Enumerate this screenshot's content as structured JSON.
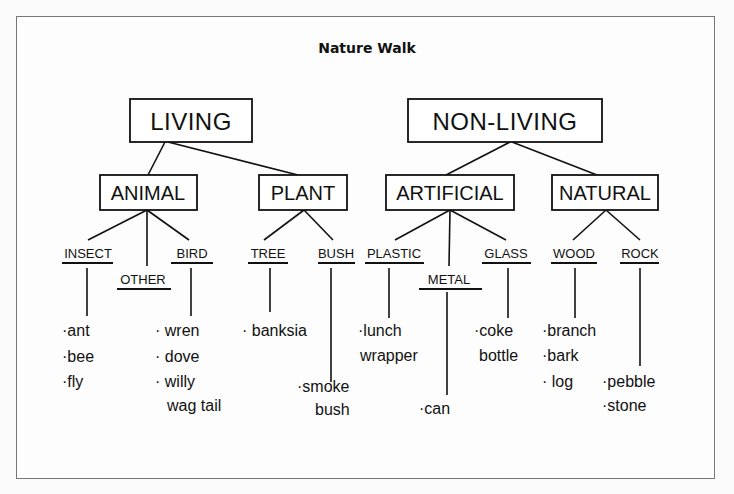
{
  "title": "Nature Walk",
  "tree": {
    "living": {
      "label": "LIVING",
      "animal": {
        "label": "ANIMAL",
        "insect": {
          "label": "INSECT",
          "items": [
            "·ant",
            "·bee",
            "·fly"
          ]
        },
        "other": {
          "label": "OTHER"
        },
        "bird": {
          "label": "BIRD",
          "items": [
            "· wren",
            "· dove",
            "· willy",
            "wag tail"
          ]
        }
      },
      "plant": {
        "label": "PLANT",
        "tree": {
          "label": "TREE",
          "items": [
            "· banksia"
          ]
        },
        "bush": {
          "label": "BUSH",
          "items": [
            "·smoke",
            "bush"
          ]
        }
      }
    },
    "nonliving": {
      "label": "NON-LIVING",
      "artificial": {
        "label": "ARTIFICIAL",
        "plastic": {
          "label": "PLASTIC",
          "items": [
            "·lunch",
            "wrapper"
          ]
        },
        "metal": {
          "label": "METAL",
          "items": [
            "·can"
          ]
        },
        "glass": {
          "label": "GLASS",
          "items": [
            "·coke",
            "bottle"
          ]
        }
      },
      "natural": {
        "label": "NATURAL",
        "wood": {
          "label": "WOOD",
          "items": [
            "·branch",
            "·bark",
            "· log"
          ]
        },
        "rock": {
          "label": "ROCK",
          "items": [
            "·pebble",
            "·stone"
          ]
        }
      }
    }
  }
}
